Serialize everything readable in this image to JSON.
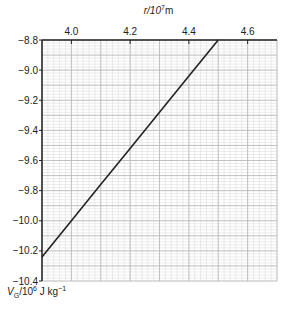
{
  "chart_data": {
    "type": "line",
    "title": "",
    "xlabel": "r/10^7 m",
    "ylabel": "V_G/10^6 J kg^-1",
    "xlim": [
      3.9,
      4.7
    ],
    "ylim": [
      -10.4,
      -8.8
    ],
    "x_axis_position": "top",
    "x_ticks": [
      4.0,
      4.2,
      4.4,
      4.6
    ],
    "x_tick_labels": [
      "4.0",
      "4.2",
      "4.4",
      "4.6"
    ],
    "y_ticks": [
      -8.8,
      -9.0,
      -9.2,
      -9.4,
      -9.6,
      -9.8,
      -10.0,
      -10.2,
      -10.4
    ],
    "y_tick_labels": [
      "−8.8",
      "−9.0",
      "−9.2",
      "−9.4",
      "−9.6",
      "−9.8",
      "−10.0",
      "−10.2",
      "−10.4"
    ],
    "grid": true,
    "grid_major_x": 0.1,
    "grid_minor_x": 0.02,
    "grid_major_y": 0.1,
    "grid_minor_y": 0.02,
    "series": [
      {
        "name": "V_G",
        "x": [
          3.9,
          4.0,
          4.1,
          4.2,
          4.3,
          4.4,
          4.5
        ],
        "y": [
          -10.24,
          -10.0,
          -9.76,
          -9.52,
          -9.28,
          -9.04,
          -8.8
        ]
      }
    ],
    "colors": {
      "line": "#222222",
      "grid_major": "#b8b8b8",
      "grid_minor": "#dddddd",
      "axis": "#222222"
    }
  },
  "labels": {
    "x_prefix": "r/10",
    "x_exp": "7",
    "x_unit": "m",
    "y_prefix": "V",
    "y_sub": "G",
    "y_mid": "/10",
    "y_exp": "6",
    "y_unit": " J kg",
    "y_unit_exp": "−1"
  }
}
